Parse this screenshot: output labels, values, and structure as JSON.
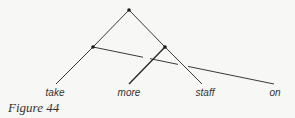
{
  "figure": {
    "caption": "Figure 44",
    "colors": {
      "background": "#f7f7f5",
      "line": "#3a3a3a",
      "node": "#1a1a1a",
      "text": "#333333"
    },
    "leaves": [
      {
        "label": "take",
        "x": 55
      },
      {
        "label": "more",
        "x": 129
      },
      {
        "label": "staff",
        "x": 204
      },
      {
        "label": "on",
        "x": 275
      }
    ],
    "nodes": [
      {
        "id": "root",
        "x": 129,
        "y": 10
      },
      {
        "id": "left-inner",
        "x": 93,
        "y": 47
      },
      {
        "id": "right-inner",
        "x": 165,
        "y": 47
      }
    ],
    "edges": [
      {
        "from": "root",
        "to": "left-inner"
      },
      {
        "from": "left-inner",
        "to": "take"
      },
      {
        "from": "root",
        "to": "right-inner"
      },
      {
        "from": "right-inner",
        "to": "staff"
      },
      {
        "from": "right-inner",
        "to": "more"
      },
      {
        "from": "left-inner",
        "to": "on",
        "crosses": [
          "more",
          "staff"
        ]
      }
    ]
  }
}
